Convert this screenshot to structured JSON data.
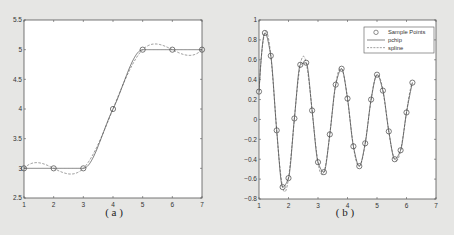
{
  "chart_data": [
    {
      "type": "line",
      "panel": "a",
      "caption": "( a )",
      "title": "",
      "xlabel": "",
      "ylabel": "",
      "xlim": [
        1,
        7
      ],
      "ylim": [
        2.5,
        5.5
      ],
      "xticks": [
        1,
        2,
        3,
        4,
        5,
        6,
        7
      ],
      "xtick_labels": [
        "1",
        "2",
        "3",
        "4",
        "5",
        "6",
        "7"
      ],
      "yticks": [
        2.5,
        3,
        3.5,
        4,
        4.5,
        5,
        5.5
      ],
      "ytick_labels": [
        "2.5",
        "3",
        "3.5",
        "4",
        "4.5",
        "5",
        "5.5"
      ],
      "grid": false,
      "legend": null,
      "series": [
        {
          "name": "Sample Points",
          "style": "circle-markers",
          "x": [
            1,
            2,
            3,
            4,
            5,
            6,
            7
          ],
          "y": [
            3,
            3,
            3,
            4,
            5,
            5,
            5
          ]
        },
        {
          "name": "pchip",
          "style": "solid",
          "x": [
            1,
            2,
            3,
            4,
            5,
            6,
            7
          ],
          "y": [
            3,
            3,
            3,
            4,
            5,
            5,
            5
          ]
        },
        {
          "name": "spline",
          "style": "dashed",
          "x": [
            1,
            2,
            3,
            4,
            5,
            6,
            7
          ],
          "y": [
            3,
            3,
            3,
            4,
            5,
            5,
            5
          ]
        }
      ]
    },
    {
      "type": "line",
      "panel": "b",
      "caption": "( b )",
      "title": "",
      "xlabel": "",
      "ylabel": "",
      "xlim": [
        1,
        7
      ],
      "ylim": [
        -0.8,
        1
      ],
      "xticks": [
        1,
        2,
        3,
        4,
        5,
        6,
        7
      ],
      "xtick_labels": [
        "1",
        "2",
        "3",
        "4",
        "5",
        "6",
        "7"
      ],
      "yticks": [
        -0.8,
        -0.6,
        -0.4,
        -0.2,
        0,
        0.2,
        0.4,
        0.6,
        0.8,
        1
      ],
      "ytick_labels": [
        "-0.8",
        "-0.6",
        "-0.4",
        "-0.2",
        "0",
        "0.2",
        "0.4",
        "0.6",
        "0.8",
        "1"
      ],
      "grid": false,
      "legend": {
        "position": "northeast",
        "entries": [
          "Sample Points",
          "pchip",
          "spline"
        ]
      },
      "series": [
        {
          "name": "Sample Points",
          "style": "circle-markers",
          "x": [
            1.0,
            1.2,
            1.4,
            1.6,
            1.8,
            2.0,
            2.2,
            2.4,
            2.6,
            2.8,
            3.0,
            3.2,
            3.4,
            3.6,
            3.8,
            4.0,
            4.2,
            4.4,
            4.6,
            4.8,
            5.0,
            5.2,
            5.4,
            5.6,
            5.8,
            6.0,
            6.2
          ],
          "y": [
            0.28,
            0.87,
            0.64,
            -0.11,
            -0.68,
            -0.59,
            0.01,
            0.55,
            0.57,
            0.09,
            -0.43,
            -0.53,
            -0.15,
            0.35,
            0.51,
            0.21,
            -0.27,
            -0.47,
            -0.24,
            0.2,
            0.45,
            0.29,
            -0.12,
            -0.4,
            -0.31,
            0.07,
            0.37
          ]
        },
        {
          "name": "pchip",
          "style": "solid"
        },
        {
          "name": "spline",
          "style": "dashed"
        }
      ]
    }
  ],
  "captions": {
    "a": "( a )",
    "b": "( b )"
  },
  "legend_b": {
    "entries": [
      "Sample Points",
      "pchip",
      "spline"
    ]
  }
}
